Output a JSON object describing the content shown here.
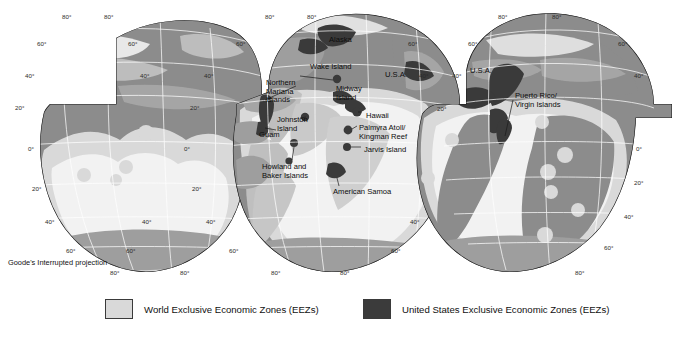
{
  "figure": {
    "projection_caption": "Goode's Interrupted projection",
    "colors": {
      "world_eez": "#d9d9d9",
      "us_eez": "#3b3b3b",
      "ocean": "#f2f2f2",
      "land": "#8c8c8c",
      "land_interior": "#a6a6a6",
      "outline": "#1a1a1a",
      "graticule": "#ffffff",
      "background": "#ffffff"
    }
  },
  "map": {
    "place_labels": [
      {
        "name": "alaska",
        "text": "Alaska",
        "x": 329,
        "y": 36
      },
      {
        "name": "wake-island",
        "text": "Wake Island",
        "x": 310,
        "y": 63
      },
      {
        "name": "usa-pacific",
        "text": "U.S.A.",
        "x": 385,
        "y": 71
      },
      {
        "name": "usa-atlantic",
        "text": "U.S.A.",
        "x": 470,
        "y": 67
      },
      {
        "name": "northern-mariana-islands",
        "text": "Northern\nMariana\nIslands",
        "x": 266,
        "y": 79
      },
      {
        "name": "midway-island",
        "text": "Midway\nIsland",
        "x": 336,
        "y": 85
      },
      {
        "name": "hawaii",
        "text": "Hawaii",
        "x": 366,
        "y": 112
      },
      {
        "name": "johnston-island",
        "text": "Johnston\nIsland",
        "x": 277,
        "y": 116
      },
      {
        "name": "guam",
        "text": "Guam",
        "x": 259,
        "y": 131
      },
      {
        "name": "palmyra-atoll-kingman-reef",
        "text": "Palmyra Atoll/\nKingman Reef",
        "x": 359,
        "y": 124
      },
      {
        "name": "jarvis-island",
        "text": "Jarvis Island",
        "x": 364,
        "y": 146
      },
      {
        "name": "howland-and-baker-islands",
        "text": "Howland and\nBaker Islands",
        "x": 262,
        "y": 163
      },
      {
        "name": "american-samoa",
        "text": "American Samoa",
        "x": 333,
        "y": 188
      },
      {
        "name": "puerto-rico-virgin-islands",
        "text": "Puerto Rico/\nVirgin Islands",
        "x": 515,
        "y": 92
      }
    ],
    "graticule_labels": [
      {
        "text": "80°",
        "x": 62,
        "y": 14
      },
      {
        "text": "80°",
        "x": 104,
        "y": 14
      },
      {
        "text": "60°",
        "x": 37,
        "y": 41
      },
      {
        "text": "60°",
        "x": 128,
        "y": 41
      },
      {
        "text": "40°",
        "x": 25,
        "y": 73
      },
      {
        "text": "40°",
        "x": 140,
        "y": 73
      },
      {
        "text": "20°",
        "x": 15,
        "y": 105
      },
      {
        "text": "0°",
        "x": 28,
        "y": 146
      },
      {
        "text": "20°",
        "x": 32,
        "y": 186
      },
      {
        "text": "40°",
        "x": 45,
        "y": 219
      },
      {
        "text": "40°",
        "x": 142,
        "y": 219
      },
      {
        "text": "60°",
        "x": 66,
        "y": 248
      },
      {
        "text": "60°",
        "x": 126,
        "y": 248
      },
      {
        "text": "80°",
        "x": 110,
        "y": 270
      },
      {
        "text": "80°",
        "x": 180,
        "y": 270
      },
      {
        "text": "80°",
        "x": 265,
        "y": 14
      },
      {
        "text": "80°",
        "x": 307,
        "y": 14
      },
      {
        "text": "60°",
        "x": 236,
        "y": 41
      },
      {
        "text": "60°",
        "x": 408,
        "y": 41
      },
      {
        "text": "40°",
        "x": 204,
        "y": 73
      },
      {
        "text": "40°",
        "x": 419,
        "y": 73
      },
      {
        "text": "20°",
        "x": 190,
        "y": 105
      },
      {
        "text": "20°",
        "x": 437,
        "y": 106
      },
      {
        "text": "0°",
        "x": 184,
        "y": 146
      },
      {
        "text": "20°",
        "x": 192,
        "y": 186
      },
      {
        "text": "40°",
        "x": 206,
        "y": 219
      },
      {
        "text": "40°",
        "x": 410,
        "y": 219
      },
      {
        "text": "60°",
        "x": 229,
        "y": 248
      },
      {
        "text": "60°",
        "x": 391,
        "y": 248
      },
      {
        "text": "80°",
        "x": 271,
        "y": 270
      },
      {
        "text": "80°",
        "x": 340,
        "y": 270
      },
      {
        "text": "80°",
        "x": 498,
        "y": 14
      },
      {
        "text": "80°",
        "x": 552,
        "y": 14
      },
      {
        "text": "60°",
        "x": 468,
        "y": 41
      },
      {
        "text": "60°",
        "x": 618,
        "y": 41
      },
      {
        "text": "40°",
        "x": 452,
        "y": 73
      },
      {
        "text": "40°",
        "x": 634,
        "y": 73
      },
      {
        "text": "0°",
        "x": 636,
        "y": 146
      },
      {
        "text": "20°",
        "x": 634,
        "y": 180
      },
      {
        "text": "40°",
        "x": 624,
        "y": 214
      },
      {
        "text": "60°",
        "x": 604,
        "y": 245
      },
      {
        "text": "80°",
        "x": 575,
        "y": 270
      }
    ]
  },
  "legend": {
    "items": [
      {
        "name": "legend-world-eez",
        "label": "World Exclusive Economic Zones (EEZs)",
        "swatch": "world",
        "x": 105
      },
      {
        "name": "legend-us-eez",
        "label": "United States Exclusive Economic Zones (EEZs)",
        "swatch": "us",
        "x": 363
      }
    ]
  }
}
